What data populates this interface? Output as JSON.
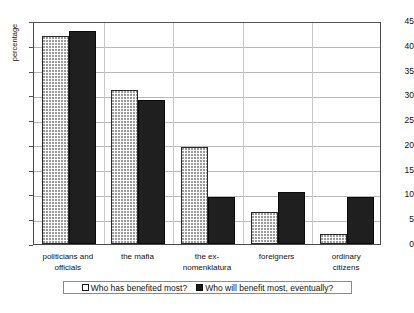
{
  "chart_data": {
    "type": "bar",
    "title": "",
    "xlabel": "",
    "ylabel": "percentage",
    "ylim": [
      0,
      45
    ],
    "ytick_step": 5,
    "yticks": [
      0,
      5,
      10,
      15,
      20,
      25,
      30,
      35,
      40,
      45
    ],
    "grid": true,
    "legend_position": "bottom",
    "categories": [
      "politicians and officials",
      "the mafia",
      "the ex-nomenklatura",
      "foreigners",
      "ordinary citizens"
    ],
    "category_lines": [
      [
        "politicians and",
        "officials"
      ],
      [
        "the mafia",
        ""
      ],
      [
        "the ex-",
        "nomenklatura"
      ],
      [
        "foreigners",
        ""
      ],
      [
        "ordinary",
        "citizens"
      ]
    ],
    "series": [
      {
        "name": "Who has benefited most?",
        "style": "light-dotted",
        "color": "#fbfbfb",
        "values": [
          42,
          31,
          19.5,
          6.5,
          2
        ]
      },
      {
        "name": "Who will benefit most, eventually?",
        "style": "solid-dark",
        "color": "#201f1f",
        "values": [
          43,
          29,
          9.5,
          10.5,
          9.5
        ]
      }
    ]
  },
  "legend": {
    "entries": [
      {
        "label": "Who has benefited most?",
        "swatch": "light"
      },
      {
        "label": "Who will benefit most, eventually?",
        "swatch": "dark"
      }
    ]
  },
  "caption": {
    "text": ""
  }
}
